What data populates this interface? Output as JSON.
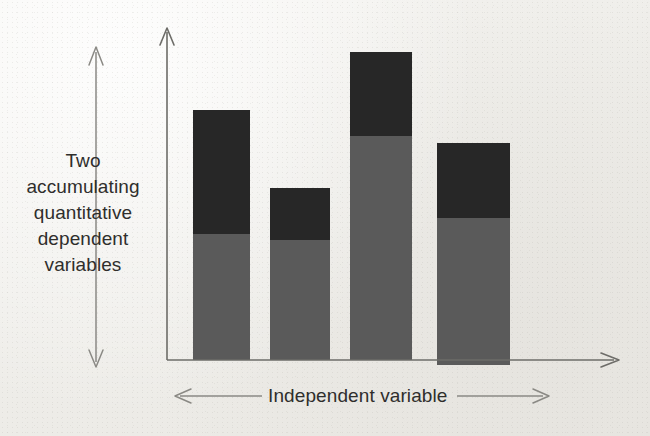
{
  "chart_data": {
    "type": "bar",
    "stacked": true,
    "title": "",
    "subtitle": "",
    "xlabel": "Independent variable",
    "ylabel": "Two accumulating quantitative dependent variables",
    "categories": [
      "1",
      "2",
      "3",
      "4"
    ],
    "series": [
      {
        "name": "lower accumulating variable",
        "color": "#5a5a5a",
        "values": [
          126,
          120,
          224,
          147
        ]
      },
      {
        "name": "upper accumulating variable",
        "color": "#272727",
        "values": [
          124,
          52,
          84,
          75
        ]
      }
    ],
    "totals": [
      250,
      172,
      308,
      222
    ],
    "ylim": [
      0,
      330
    ],
    "xlim": [
      0,
      4
    ],
    "grid": false,
    "legend": "none",
    "axis_ticks": [],
    "tick_labels": []
  },
  "labels": {
    "y_axis": "Two\naccumulating\nquantitative\ndependent\nvariables",
    "x_axis": "Independent variable"
  },
  "colors": {
    "segment_upper": "#272727",
    "segment_lower": "#5a5a5a",
    "axis": "#6d6c68",
    "range_arrow": "#8a8984",
    "text": "#2f2e2c",
    "background": "#efeeea"
  },
  "geometry": {
    "baseline_y": 360,
    "y_axis_x": 167,
    "bars": [
      {
        "x": 193,
        "width": 57,
        "top": 110,
        "split": 234,
        "bottom": 360
      },
      {
        "x": 270,
        "width": 60,
        "top": 188,
        "split": 240,
        "bottom": 360
      },
      {
        "x": 350,
        "width": 62,
        "top": 52,
        "split": 136,
        "bottom": 360
      },
      {
        "x": 437,
        "width": 73,
        "top": 143,
        "split": 218,
        "bottom": 365
      }
    ]
  }
}
